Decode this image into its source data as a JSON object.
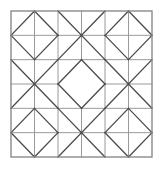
{
  "figure": {
    "name": "quilt-block-pattern",
    "canvas": {
      "width": 162,
      "height": 178
    },
    "background_color": "#ffffff"
  },
  "geometry": {
    "frame": {
      "x": 11,
      "y": 11,
      "width": 141,
      "height": 146
    },
    "grid": {
      "columns": 6,
      "rows": 6
    },
    "cell": {
      "width": 23.5,
      "height": 24.3333
    },
    "block_grid": {
      "columns": 3,
      "rows": 3,
      "cells_per_block": 2
    }
  },
  "style": {
    "frame_color": "#8a8a8a",
    "grid_color": "#9a9a9a",
    "diagonal_color": "#4a4a4a",
    "frame_width": 1.4,
    "grid_width": 1.0,
    "diagonal_width": 1.3,
    "fill_color": "none"
  },
  "blocks": [
    {
      "row": 0,
      "col": 0,
      "motif": "diamond-cross",
      "label": "top-left"
    },
    {
      "row": 0,
      "col": 1,
      "motif": "x-cross",
      "label": "top-center"
    },
    {
      "row": 0,
      "col": 2,
      "motif": "diamond-cross",
      "label": "top-right"
    },
    {
      "row": 1,
      "col": 0,
      "motif": "x-cross",
      "label": "middle-left"
    },
    {
      "row": 1,
      "col": 1,
      "motif": "diamond-plain",
      "label": "center"
    },
    {
      "row": 1,
      "col": 2,
      "motif": "x-cross",
      "label": "middle-right"
    },
    {
      "row": 2,
      "col": 0,
      "motif": "diamond-cross",
      "label": "bottom-left"
    },
    {
      "row": 2,
      "col": 1,
      "motif": "x-cross",
      "label": "bottom-center"
    },
    {
      "row": 2,
      "col": 2,
      "motif": "diamond-cross",
      "label": "bottom-right"
    }
  ],
  "motif_definitions": {
    "diamond-cross": {
      "description": "Square with inscribed diamond joining edge midpoints, plus horizontal and vertical center lines",
      "diamond": true,
      "cross": true,
      "full_diagonals": false
    },
    "x-cross": {
      "description": "Square with both full corner-to-corner diagonals plus horizontal and vertical center lines",
      "diamond": false,
      "cross": true,
      "full_diagonals": true
    },
    "diamond-plain": {
      "description": "Square with inscribed diamond only, no interior grid lines",
      "diamond": true,
      "cross": false,
      "full_diagonals": false
    }
  },
  "chart_data": {
    "type": "diagram",
    "xlabel": "",
    "ylabel": "",
    "grid": true,
    "legend_position": "none",
    "categories": [
      "top-left",
      "top-center",
      "top-right",
      "middle-left",
      "center",
      "middle-right",
      "bottom-left",
      "bottom-center",
      "bottom-right"
    ],
    "values": [
      "diamond-cross",
      "x-cross",
      "diamond-cross",
      "x-cross",
      "diamond-plain",
      "x-cross",
      "diamond-cross",
      "x-cross",
      "diamond-cross"
    ]
  }
}
